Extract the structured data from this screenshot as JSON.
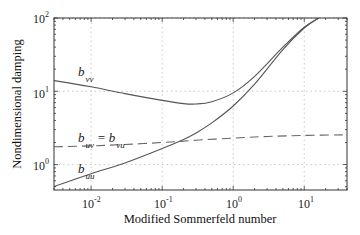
{
  "chart_data": {
    "type": "line",
    "title": "",
    "xlabel": "Modified Sommerfeld number",
    "ylabel": "Nondimensional damping",
    "xscale": "log",
    "yscale": "log",
    "xlim": [
      0.003,
      40
    ],
    "ylim": [
      0.45,
      100
    ],
    "grid": true,
    "x_ticks": [
      {
        "base": "10",
        "exp": "-2"
      },
      {
        "base": "10",
        "exp": "-1"
      },
      {
        "base": "10",
        "exp": "0"
      },
      {
        "base": "10",
        "exp": "1"
      }
    ],
    "y_ticks": [
      {
        "base": "10",
        "exp": "0"
      },
      {
        "base": "10",
        "exp": "1"
      },
      {
        "base": "10",
        "exp": "2"
      }
    ],
    "series": [
      {
        "name": "b_vv",
        "label_main": "b",
        "label_sub": "vv",
        "style": "solid",
        "x": [
          0.003,
          0.01,
          0.03,
          0.1,
          0.2,
          0.3,
          0.5,
          1,
          2,
          5,
          10,
          16
        ],
        "y": [
          14,
          11.5,
          9.3,
          7.5,
          6.8,
          6.7,
          7.2,
          9.5,
          16,
          40,
          75,
          100
        ]
      },
      {
        "name": "b_uu",
        "label_main": "b",
        "label_sub": "uu",
        "style": "solid",
        "x": [
          0.003,
          0.01,
          0.03,
          0.1,
          0.2,
          0.3,
          0.5,
          1,
          2,
          5,
          10,
          16
        ],
        "y": [
          0.5,
          0.75,
          1.05,
          1.65,
          2.2,
          2.7,
          3.7,
          6.3,
          12.5,
          37,
          73,
          100
        ]
      },
      {
        "name": "b_uv = b_vu",
        "label_main": "b",
        "label_sub": "uv",
        "label_eq": "=",
        "label_main2": "b",
        "label_sub2": "vu",
        "style": "dashed",
        "x": [
          0.003,
          0.01,
          0.03,
          0.1,
          0.3,
          1,
          3,
          10,
          40
        ],
        "y": [
          1.75,
          1.8,
          1.88,
          2.0,
          2.15,
          2.3,
          2.42,
          2.5,
          2.55
        ]
      }
    ]
  }
}
